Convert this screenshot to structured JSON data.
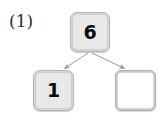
{
  "figure": {
    "label": "(1)",
    "background_color": "#ffffff"
  },
  "diagram": {
    "type": "tree",
    "edge_color": "#9a9a9a",
    "node_fill_color": "#e8e8e8",
    "node_border_color": "#b4b4b4",
    "node_empty_fill_color": "#ffffff",
    "nodes": [
      {
        "id": "root",
        "value": "6",
        "filled": true,
        "role": "parent"
      },
      {
        "id": "left",
        "value": "1",
        "filled": true,
        "role": "child"
      },
      {
        "id": "right",
        "value": "",
        "filled": false,
        "role": "child"
      }
    ],
    "edges": [
      {
        "from": "root",
        "to": "left",
        "arrow": true
      },
      {
        "from": "root",
        "to": "right",
        "arrow": true
      }
    ]
  }
}
